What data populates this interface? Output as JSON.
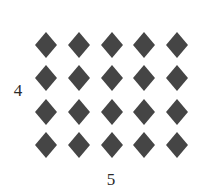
{
  "figure": {
    "kind": "array-model-diagram",
    "background_color": "#ffffff",
    "marker_color": "#454545",
    "marker_shape": "diamond",
    "row_label": "4",
    "column_label": "5",
    "rows": 4,
    "columns": 5,
    "total_markers": 20
  },
  "chart_data": {
    "type": "table",
    "title": "",
    "subtitle": "",
    "xlabel": "5",
    "ylabel": "4",
    "rows": 4,
    "columns": 5,
    "values": [
      [
        "diamond",
        "diamond",
        "diamond",
        "diamond",
        "diamond"
      ],
      [
        "diamond",
        "diamond",
        "diamond",
        "diamond",
        "diamond"
      ],
      [
        "diamond",
        "diamond",
        "diamond",
        "diamond",
        "diamond"
      ],
      [
        "diamond",
        "diamond",
        "diamond",
        "diamond",
        "diamond"
      ]
    ],
    "row_counts": [
      5,
      5,
      5,
      5
    ],
    "column_counts": [
      4,
      4,
      4,
      4,
      4
    ],
    "total": 20,
    "tick_labels": {
      "rows": "4",
      "columns": "5"
    },
    "grid": false,
    "legend": "none",
    "marker_color": "#454545"
  }
}
